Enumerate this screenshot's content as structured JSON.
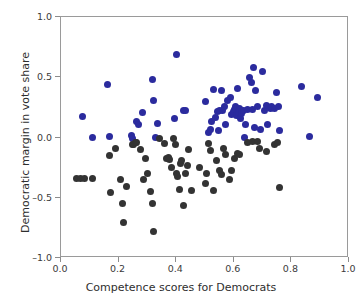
{
  "chart_data": {
    "type": "scatter",
    "title": "",
    "xlabel": "Competence scores for Democrats",
    "ylabel": "Democratic margin in vote share",
    "xlim": [
      0.0,
      1.0
    ],
    "ylim": [
      -1.0,
      1.0
    ],
    "xticks": [
      "0.0",
      "0.2",
      "0.4",
      "0.6",
      "0.8",
      "1.0"
    ],
    "xtick_values": [
      0.0,
      0.2,
      0.4,
      0.6,
      0.8,
      1.0
    ],
    "yticks": [
      "1.0",
      "0.5",
      "0.0",
      "-0.5",
      "-1.0"
    ],
    "ytick_values": [
      1.0,
      0.5,
      0.0,
      -0.5,
      -1.0
    ],
    "grid": false,
    "legend": "none",
    "colors": {
      "winners": "#2b2b9e",
      "losers": "#333333",
      "frame": "#9a9a9a",
      "text": "#2e2e2e"
    },
    "series": [
      {
        "name": "Democratic winners",
        "color": "#2b2b9e",
        "marker": "circle",
        "points": [
          [
            0.075,
            0.175
          ],
          [
            0.11,
            0.0
          ],
          [
            0.16,
            0.44
          ],
          [
            0.168,
            0.005
          ],
          [
            0.245,
            0.02
          ],
          [
            0.248,
            -0.01
          ],
          [
            0.262,
            0.13
          ],
          [
            0.268,
            0.105
          ],
          [
            0.282,
            0.205
          ],
          [
            0.318,
            0.48
          ],
          [
            0.322,
            0.31
          ],
          [
            0.328,
            0.0
          ],
          [
            0.335,
            0.115
          ],
          [
            0.395,
            0.155
          ],
          [
            0.4,
            0.69
          ],
          [
            0.425,
            0.22
          ],
          [
            0.432,
            0.225
          ],
          [
            0.5,
            0.3
          ],
          [
            0.512,
            0.04
          ],
          [
            0.518,
            0.065
          ],
          [
            0.522,
            0.135
          ],
          [
            0.528,
            0.4
          ],
          [
            0.535,
            0.17
          ],
          [
            0.542,
            0.215
          ],
          [
            0.548,
            0.06
          ],
          [
            0.552,
            0.225
          ],
          [
            0.556,
            0.39
          ],
          [
            0.562,
            0.22
          ],
          [
            0.568,
            0.255
          ],
          [
            0.572,
            0.11
          ],
          [
            0.578,
            0.31
          ],
          [
            0.588,
            0.33
          ],
          [
            0.592,
            0.195
          ],
          [
            0.598,
            0.215
          ],
          [
            0.602,
            0.23
          ],
          [
            0.606,
            0.255
          ],
          [
            0.61,
            0.185
          ],
          [
            0.612,
            0.41
          ],
          [
            0.616,
            0.21
          ],
          [
            0.62,
            0.24
          ],
          [
            0.624,
            0.16
          ],
          [
            0.628,
            0.2
          ],
          [
            0.632,
            0.22
          ],
          [
            0.636,
            0.0
          ],
          [
            0.64,
            0.105
          ],
          [
            0.648,
            0.23
          ],
          [
            0.655,
            0.5
          ],
          [
            0.66,
            0.46
          ],
          [
            0.664,
            0.235
          ],
          [
            0.668,
            0.58
          ],
          [
            0.672,
            0.085
          ],
          [
            0.676,
            0.39
          ],
          [
            0.682,
            0.255
          ],
          [
            0.694,
            0.07
          ],
          [
            0.7,
            0.55
          ],
          [
            0.706,
            0.225
          ],
          [
            0.712,
            0.265
          ],
          [
            0.718,
            0.11
          ],
          [
            0.726,
            0.24
          ],
          [
            0.732,
            0.255
          ],
          [
            0.74,
            0.24
          ],
          [
            0.748,
            0.37
          ],
          [
            0.756,
            0.255
          ],
          [
            0.76,
            0.06
          ],
          [
            0.836,
            0.42
          ],
          [
            0.862,
            0.01
          ],
          [
            0.89,
            0.33
          ]
        ]
      },
      {
        "name": "Democratic losers",
        "color": "#333333",
        "marker": "circle",
        "points": [
          [
            0.055,
            -0.34
          ],
          [
            0.068,
            -0.34
          ],
          [
            0.082,
            -0.34
          ],
          [
            0.108,
            -0.34
          ],
          [
            0.168,
            -0.15
          ],
          [
            0.172,
            -0.46
          ],
          [
            0.19,
            -0.09
          ],
          [
            0.205,
            -0.345
          ],
          [
            0.212,
            -0.545
          ],
          [
            0.216,
            -0.705
          ],
          [
            0.228,
            -0.405
          ],
          [
            0.248,
            -0.055
          ],
          [
            0.252,
            -0.06
          ],
          [
            0.258,
            -0.04
          ],
          [
            0.262,
            -0.042
          ],
          [
            0.275,
            -0.1
          ],
          [
            0.288,
            -0.35
          ],
          [
            0.295,
            -0.175
          ],
          [
            0.302,
            -0.3
          ],
          [
            0.31,
            -0.445
          ],
          [
            0.318,
            -0.55
          ],
          [
            0.322,
            -0.78
          ],
          [
            0.342,
            -0.005
          ],
          [
            0.358,
            -0.05
          ],
          [
            0.365,
            -0.175
          ],
          [
            0.372,
            -0.165
          ],
          [
            0.378,
            -0.18
          ],
          [
            0.385,
            -0.245
          ],
          [
            0.392,
            -0.01
          ],
          [
            0.398,
            -0.055
          ],
          [
            0.402,
            -0.3
          ],
          [
            0.406,
            -0.32
          ],
          [
            0.41,
            -0.43
          ],
          [
            0.415,
            -0.215
          ],
          [
            0.42,
            -0.19
          ],
          [
            0.425,
            -0.565
          ],
          [
            0.432,
            -0.295
          ],
          [
            0.438,
            -0.23
          ],
          [
            0.444,
            -0.1
          ],
          [
            0.452,
            -0.44
          ],
          [
            0.482,
            -0.25
          ],
          [
            0.5,
            -0.38
          ],
          [
            0.506,
            -0.3
          ],
          [
            0.512,
            -0.05
          ],
          [
            0.52,
            -0.11
          ],
          [
            0.528,
            -0.44
          ],
          [
            0.54,
            -0.195
          ],
          [
            0.552,
            -0.27
          ],
          [
            0.558,
            -0.31
          ],
          [
            0.564,
            -0.095
          ],
          [
            0.572,
            -0.14
          ],
          [
            0.586,
            -0.35
          ],
          [
            0.592,
            -0.275
          ],
          [
            0.604,
            -0.175
          ],
          [
            0.612,
            -0.135
          ],
          [
            0.62,
            -0.145
          ],
          [
            0.648,
            -0.045
          ],
          [
            0.666,
            -0.035
          ],
          [
            0.684,
            -0.03
          ],
          [
            0.69,
            -0.095
          ],
          [
            0.712,
            -0.12
          ],
          [
            0.742,
            -0.055
          ],
          [
            0.752,
            -0.045
          ],
          [
            0.758,
            -0.415
          ]
        ]
      }
    ]
  }
}
